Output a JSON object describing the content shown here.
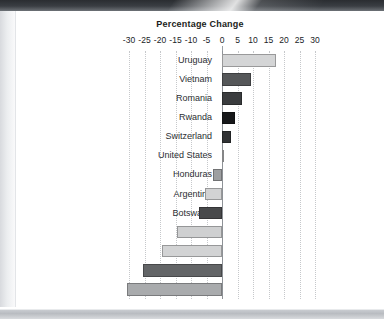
{
  "page": {
    "background": "#ffffff",
    "scan_edge_color": "#2a2d31"
  },
  "chart_data": {
    "type": "bar",
    "orientation": "horizontal",
    "title": "Percentage Change",
    "xlabel": "",
    "ylabel": "",
    "xlim": [
      -30,
      30
    ],
    "xticks": [
      -30,
      -25,
      -20,
      -15,
      -10,
      -5,
      0,
      5,
      10,
      15,
      20,
      25,
      30
    ],
    "xtick_labels": [
      "-30",
      "-25",
      "-20",
      "-15",
      "-10",
      "-5",
      "0",
      "5",
      "10",
      "15",
      "20",
      "25",
      "30"
    ],
    "grid": true,
    "grid_style": "dotted-vertical",
    "grid_color": "#c6c8cb",
    "zero_line_color": "#8e9297",
    "legend": null,
    "axis_position": "top",
    "categories": [
      "Uruguay",
      "Vietnam",
      "Romania",
      "Rwanda",
      "Switzerland",
      "United States",
      "Honduras",
      "Argentina",
      "Botswana",
      "Benin",
      "Gambia",
      "Cambodia",
      "Ivory Coast"
    ],
    "values": [
      17.3,
      9.5,
      6.5,
      4.3,
      3.0,
      0.5,
      -3.0,
      -5.5,
      -7.5,
      -14.5,
      -19.5,
      -25.5,
      -30.5
    ],
    "bar_colors": [
      "#d4d5d6",
      "#555759",
      "#3a3c3e",
      "#17181a",
      "#303234",
      "#b9babc",
      "#9d9fa1",
      "#d2d3d4",
      "#48494b",
      "#cfd0d1",
      "#d2d3d4",
      "#636567",
      "#a9abad"
    ]
  }
}
